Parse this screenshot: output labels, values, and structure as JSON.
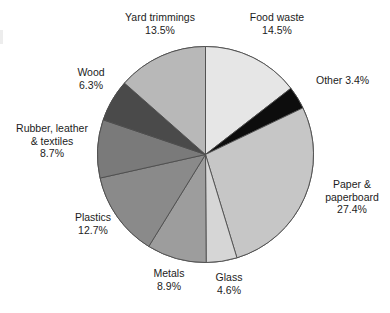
{
  "chart_data": {
    "type": "pie",
    "title": "",
    "subtitle": "",
    "xlabel": "",
    "ylabel": "",
    "legend_position": "none",
    "grid": false,
    "units": "percent",
    "start_angle_deg": 0,
    "direction": "clockwise",
    "categories": [
      "Food waste",
      "Other",
      "Paper & paperboard",
      "Glass",
      "Metals",
      "Plastics",
      "Rubber, leather & textiles",
      "Wood",
      "Yard trimmings"
    ],
    "values": [
      14.5,
      3.4,
      27.4,
      4.6,
      8.9,
      12.7,
      8.7,
      6.3,
      13.5
    ],
    "slices": [
      {
        "label": "Food waste",
        "value": 14.5,
        "value_text": "14.5%",
        "color": "#e6e6e6"
      },
      {
        "label": "Other",
        "value": 3.4,
        "value_text": "3.4%",
        "color": "#0d0d0d"
      },
      {
        "label": "Paper & paperboard",
        "value": 27.4,
        "value_text": "27.4%",
        "color": "#c6c6c6"
      },
      {
        "label": "Glass",
        "value": 4.6,
        "value_text": "4.6%",
        "color": "#d6d6d6"
      },
      {
        "label": "Metals",
        "value": 8.9,
        "value_text": "8.9%",
        "color": "#9d9d9d"
      },
      {
        "label": "Plastics",
        "value": 12.7,
        "value_text": "12.7%",
        "color": "#8a8a8a"
      },
      {
        "label": "Rubber, leather & textiles",
        "value": 8.7,
        "value_text": "8.7%",
        "color": "#7a7a7a"
      },
      {
        "label": "Wood",
        "value": 6.3,
        "value_text": "6.3%",
        "color": "#4a4a4a"
      },
      {
        "label": "Yard trimmings",
        "value": 13.5,
        "value_text": "13.5%",
        "color": "#b8b8b8"
      }
    ],
    "stroke_color": "#4d4d4d"
  },
  "labels": {
    "yard_trimmings": {
      "name": "Yard trimmings",
      "value": "13.5%"
    },
    "food_waste": {
      "name": "Food waste",
      "value": "14.5%"
    },
    "other": {
      "name": "Other 3.4%"
    },
    "paper": {
      "line1": "Paper &",
      "line2": "paperboard",
      "value": "27.4%"
    },
    "glass": {
      "name": "Glass",
      "value": "4.6%"
    },
    "metals": {
      "name": "Metals",
      "value": "8.9%"
    },
    "plastics": {
      "name": "Plastics",
      "value": "12.7%"
    },
    "rubber": {
      "line1": "Rubber, leather",
      "line2": "& textiles",
      "value": "8.7%"
    },
    "wood": {
      "name": "Wood",
      "value": "6.3%"
    }
  }
}
